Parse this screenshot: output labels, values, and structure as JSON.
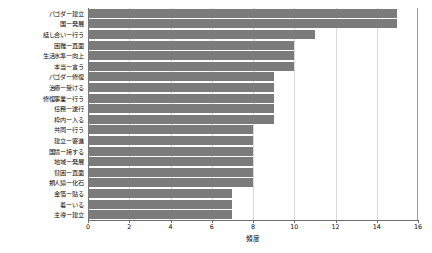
{
  "chart_data": {
    "type": "bar",
    "orientation": "horizontal",
    "title": "",
    "xlabel": "頻度",
    "ylabel": "",
    "xlim": [
      0,
      16
    ],
    "xticks": [
      0,
      2,
      4,
      6,
      8,
      10,
      12,
      14,
      16
    ],
    "grid": true,
    "legend": false,
    "bar_color": "#7b7b7b",
    "categories": [
      "パゴダー建立",
      "国ー発展",
      "話し合いー行う",
      "困難ー直面",
      "生活水準ー向上",
      "本当ー言う",
      "パゴダー修復",
      "治療ー受ける",
      "修復事業ー行う",
      "任務ー遂行",
      "枠内ー入る",
      "共同ー行う",
      "建立ー寄進",
      "国境ー接する",
      "地域ー発展",
      "貧困ー直面",
      "類人猿ー化石",
      "金箔ー貼る",
      "着ーいる",
      "主導ー建立"
    ],
    "values": [
      15,
      15,
      11,
      10,
      10,
      10,
      9,
      9,
      9,
      9,
      9,
      8,
      8,
      8,
      8,
      8,
      8,
      7,
      7,
      7
    ]
  }
}
